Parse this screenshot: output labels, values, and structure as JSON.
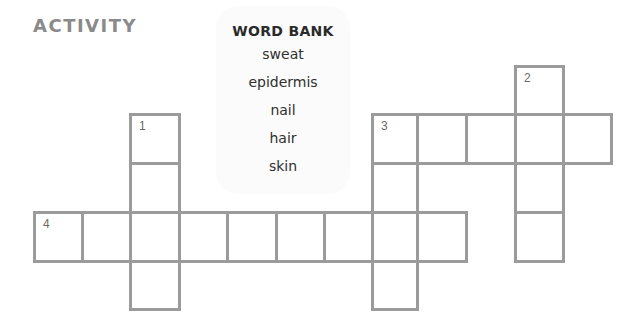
{
  "header": {
    "title": "ACTIVITY"
  },
  "word_bank": {
    "title": "WORD BANK",
    "words": [
      "sweat",
      "epidermis",
      "nail",
      "hair",
      "skin"
    ]
  },
  "grid": {
    "colors": {
      "border": "#9b9b9b",
      "number": "#6a6a6a",
      "title": "#8a8a8a"
    },
    "column_x": [
      33,
      81,
      129,
      178,
      226,
      275,
      323,
      371,
      416,
      465,
      514,
      562
    ],
    "row_y": [
      65,
      113,
      162,
      211,
      260
    ],
    "clues": [
      {
        "number": "1",
        "direction": "down",
        "row": 1,
        "col": 2,
        "length": 4
      },
      {
        "number": "2",
        "direction": "down",
        "row": 0,
        "col": 10,
        "length": 4
      },
      {
        "number": "3",
        "direction": "across",
        "row": 1,
        "col": 7,
        "length": 5
      },
      {
        "number": "3",
        "direction": "down",
        "row": 1,
        "col": 7,
        "length": 4
      },
      {
        "number": "4",
        "direction": "across",
        "row": 3,
        "col": 0,
        "length": 9
      }
    ]
  }
}
